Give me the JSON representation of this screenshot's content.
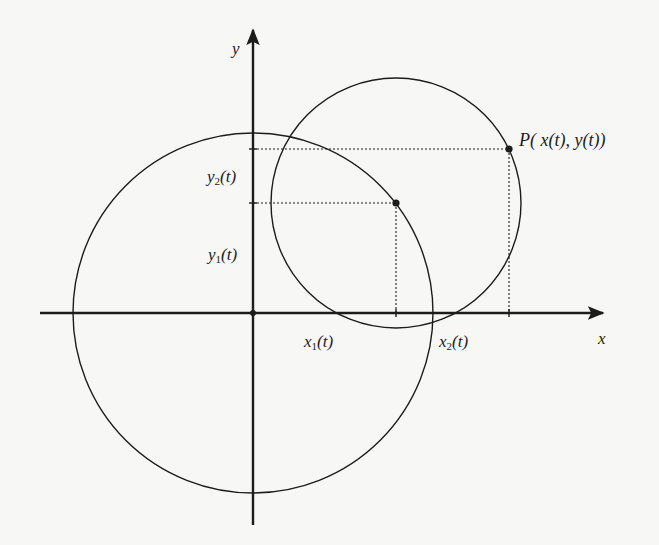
{
  "diagram": {
    "title": "",
    "colors": {
      "ink": "#1c1c1c",
      "background": "#f7f7f5"
    },
    "axes": {
      "x_label": "x",
      "y_label": "y",
      "origin_px": [
        253,
        313
      ]
    },
    "circles": [
      {
        "name": "large-circle",
        "center": "origin",
        "center_px": [
          253,
          313
        ],
        "radius_px": 180
      },
      {
        "name": "small-circle",
        "center": "point-1",
        "center_px": [
          396,
          203
        ],
        "radius_px": 125
      }
    ],
    "points": [
      {
        "name": "point-1",
        "px": [
          396,
          203
        ],
        "x_label_base": "x",
        "x_label_sub": "1",
        "x_label_arg": "(t)",
        "y_label_base": "y",
        "y_label_sub": "1",
        "y_label_arg": "(t)"
      },
      {
        "name": "point-P",
        "px": [
          509,
          149
        ],
        "label": "P( x(t), y(t))",
        "x_label_base": "x",
        "x_label_sub": "2",
        "x_label_arg": "(t)",
        "y_label_base": "y",
        "y_label_sub": "2",
        "y_label_arg": "(t)"
      }
    ],
    "labels": {
      "y_axis": "y",
      "x_axis": "x",
      "y2": {
        "base": "y",
        "sub": "2",
        "arg": "(t)"
      },
      "y1": {
        "base": "y",
        "sub": "1",
        "arg": "(t)"
      },
      "x1": {
        "base": "x",
        "sub": "1",
        "arg": "(t)"
      },
      "x2": {
        "base": "x",
        "sub": "2",
        "arg": "(t)"
      },
      "P": "P( x(t), y(t))"
    }
  }
}
